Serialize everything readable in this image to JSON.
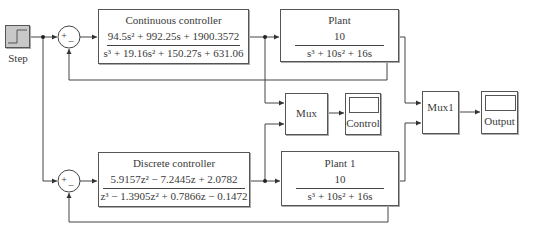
{
  "diagram": {
    "type": "simulink_block_diagram",
    "blocks": {
      "step": {
        "label": "Step"
      },
      "sum1": {
        "plus": "+",
        "minus": "_"
      },
      "sum2": {
        "plus": "+",
        "minus": "_"
      },
      "continuous_controller": {
        "title": "Continuous controller",
        "numerator": "94.5s² + 992.25s + 1900.3572",
        "denominator": "s³ + 19.16s² + 150.27s + 631.06"
      },
      "plant": {
        "title": "Plant",
        "numerator": "10",
        "denominator": "s³ + 10s² + 16s"
      },
      "discrete_controller": {
        "title": "Discrete controller",
        "numerator": "5.9157z² − 7.2445z + 2.0782",
        "denominator": "z³ − 1.3905z² + 0.7866z − 0.1472"
      },
      "plant1": {
        "title": "Plant 1",
        "numerator": "10",
        "denominator": "s³ + 10s² + 16s"
      },
      "mux": {
        "label": "Mux"
      },
      "mux1": {
        "label": "Mux1"
      },
      "control_scope": {
        "label": "Control"
      },
      "output_scope": {
        "label": "Output"
      }
    },
    "connections": [
      [
        "Step",
        "Sum1"
      ],
      [
        "Step",
        "Sum2"
      ],
      [
        "Sum1",
        "Continuous controller"
      ],
      [
        "Continuous controller",
        "Plant"
      ],
      [
        "Continuous controller",
        "Mux"
      ],
      [
        "Plant",
        "Sum1 (feedback −)"
      ],
      [
        "Plant",
        "Mux1"
      ],
      [
        "Sum2",
        "Discrete controller"
      ],
      [
        "Discrete controller",
        "Plant 1"
      ],
      [
        "Discrete controller",
        "Mux"
      ],
      [
        "Plant 1",
        "Sum2 (feedback −)"
      ],
      [
        "Plant 1",
        "Mux1"
      ],
      [
        "Mux",
        "Control"
      ],
      [
        "Mux1",
        "Output"
      ]
    ],
    "colors": {
      "line": "#444444",
      "block_border": "#555555",
      "step_fill": "#bdbdbd",
      "background": "#ffffff"
    }
  }
}
